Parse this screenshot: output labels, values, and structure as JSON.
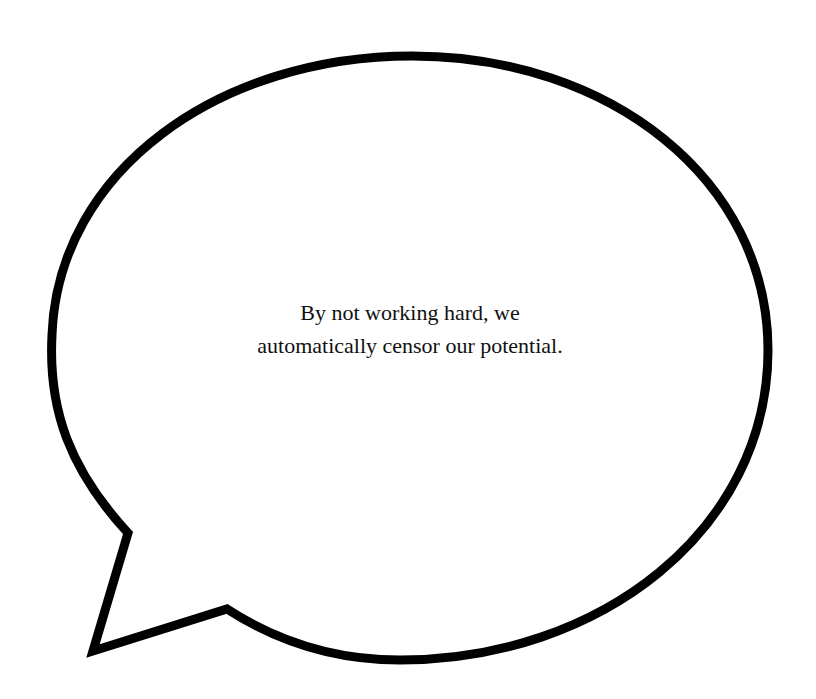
{
  "speech_bubble": {
    "lines": [
      "By not working hard, we",
      "automatically censor our potential."
    ],
    "stroke_color": "#000000",
    "fill_color": "#ffffff"
  }
}
